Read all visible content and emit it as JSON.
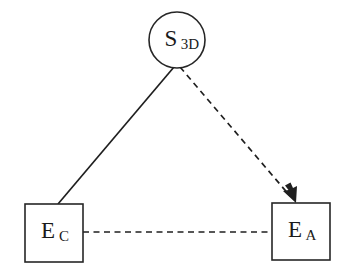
{
  "diagram": {
    "background_color": "#ffffff",
    "stroke_color": "#1f1f1f",
    "text_color": "#1a1a1a",
    "width": 344,
    "height": 278,
    "nodes": [
      {
        "id": "s3d",
        "shape": "circle",
        "label_main": "S",
        "label_sub": "3D",
        "cx": 177,
        "cy": 40,
        "r": 28
      },
      {
        "id": "ec",
        "shape": "rectangle",
        "label_main": "E",
        "label_sub": "C",
        "x": 25,
        "y": 204,
        "width": 58,
        "height": 58
      },
      {
        "id": "ea",
        "shape": "rectangle",
        "label_main": "E",
        "label_sub": "A",
        "x": 272,
        "y": 203,
        "width": 58,
        "height": 57
      }
    ],
    "edges": [
      {
        "id": "ec-to-s3d",
        "from": "ec",
        "to": "s3d",
        "style": "solid",
        "arrowhead": "none",
        "x1": 58,
        "y1": 204,
        "x2": 174,
        "y2": 67
      },
      {
        "id": "s3d-to-ea",
        "from": "s3d",
        "to": "ea",
        "style": "dashed",
        "arrowhead": "end",
        "x1": 180,
        "y1": 67,
        "x2": 295,
        "y2": 202
      },
      {
        "id": "ec-to-ea",
        "from": "ec",
        "to": "ea",
        "style": "dashed",
        "arrowhead": "none",
        "x1": 83,
        "y1": 232,
        "x2": 272,
        "y2": 232
      }
    ]
  }
}
